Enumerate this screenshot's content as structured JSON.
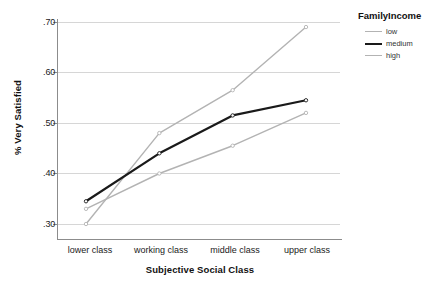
{
  "chart_data": {
    "type": "line",
    "title": "",
    "xlabel": "Subjective Social Class",
    "ylabel": "% Very Satisfied",
    "categories": [
      "lower class",
      "working class",
      "middle class",
      "upper class"
    ],
    "ylim": [
      0.28,
      0.72
    ],
    "yticks": [
      ".30",
      ".40",
      ".50",
      ".60",
      ".70"
    ],
    "ytick_values": [
      0.3,
      0.4,
      0.5,
      0.6,
      0.7
    ],
    "grid": true,
    "legend_position": "right",
    "legend_title": "FamilyIncome",
    "series": [
      {
        "name": "low",
        "values": [
          0.33,
          0.4,
          0.455,
          0.52
        ],
        "color": "#b3b3b3",
        "width": 1.4
      },
      {
        "name": "medium",
        "values": [
          0.345,
          0.44,
          0.515,
          0.545
        ],
        "color": "#1a1a1a",
        "width": 2.2
      },
      {
        "name": "high",
        "values": [
          0.3,
          0.48,
          0.565,
          0.69
        ],
        "color": "#b3b3b3",
        "width": 1.4
      }
    ]
  },
  "axes": {
    "x_title": "Subjective Social Class",
    "y_title": "% Very Satisfied",
    "x_categories": [
      {
        "label": "lower class"
      },
      {
        "label": "working class"
      },
      {
        "label": "middle class"
      },
      {
        "label": "upper class"
      }
    ],
    "y_ticks": [
      {
        "label": ".70"
      },
      {
        "label": ".60"
      },
      {
        "label": ".50"
      },
      {
        "label": ".40"
      },
      {
        "label": ".30"
      }
    ]
  },
  "legend": {
    "title": "FamilyIncome",
    "items": [
      {
        "label": "low"
      },
      {
        "label": "medium"
      },
      {
        "label": "high"
      }
    ]
  },
  "colors": {
    "series_light": "#b3b3b3",
    "series_dark": "#1a1a1a",
    "grid": "#d6d6d6",
    "axis": "#8c8c8c",
    "text": "#1a1a1a",
    "background": "#ffffff"
  }
}
